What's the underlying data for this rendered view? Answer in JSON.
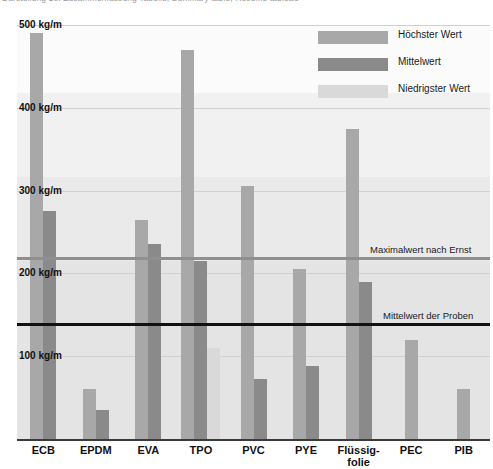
{
  "caption": {
    "text": "Darstellung 10: Zusammenfassung Tabelle; Summary table; Résumé tableau"
  },
  "legend": {
    "items": [
      {
        "label": "Höchster Wert",
        "key": "high",
        "color": "#a8a8a8"
      },
      {
        "label": "Mittelwert",
        "key": "mid",
        "color": "#8a8a8a"
      },
      {
        "label": "Niedrigster Wert",
        "key": "low",
        "color": "#d9d9d9"
      }
    ]
  },
  "axis": {
    "y_ticks": [
      "500 kg/m",
      "400 kg/m",
      "300 kg/m",
      "200 kg/m",
      "100 kg/m"
    ],
    "y_unit": "kg/m"
  },
  "reflines": [
    {
      "label": "Maximalwert nach Ernst",
      "value": 220,
      "color": "#8f8f8f"
    },
    {
      "label": "Mittelwert der Proben",
      "value": 140,
      "color": "#111111"
    }
  ],
  "categories": [
    "ECB",
    "EPDM",
    "EVA",
    "TPO",
    "PVC",
    "PYE",
    "Flüssig-\nfolie",
    "PEC",
    "PIB"
  ],
  "chart_data": {
    "type": "bar",
    "title": "Darstellung 10: Zusammenfassung Tabelle; Summary table; Résumé tableau",
    "xlabel": "",
    "ylabel": "kg/m",
    "ylim": [
      0,
      500
    ],
    "grid": true,
    "legend_position": "top-right",
    "categories": [
      "ECB",
      "EPDM",
      "EVA",
      "TPO",
      "PVC",
      "PYE",
      "Flüssigfolie",
      "PEC",
      "PIB"
    ],
    "series": [
      {
        "name": "Höchster Wert",
        "color": "#a8a8a8",
        "values": [
          490,
          60,
          265,
          470,
          305,
          205,
          375,
          120,
          60
        ]
      },
      {
        "name": "Mittelwert",
        "color": "#8a8a8a",
        "values": [
          275,
          35,
          235,
          215,
          72,
          88,
          190,
          null,
          null
        ]
      },
      {
        "name": "Niedrigster Wert",
        "color": "#d9d9d9",
        "values": [
          null,
          null,
          null,
          110,
          null,
          null,
          null,
          null,
          null
        ]
      }
    ],
    "annotations": [
      {
        "text": "Maximalwert nach Ernst",
        "y": 220
      },
      {
        "text": "Mittelwert der Proben",
        "y": 140
      }
    ]
  }
}
